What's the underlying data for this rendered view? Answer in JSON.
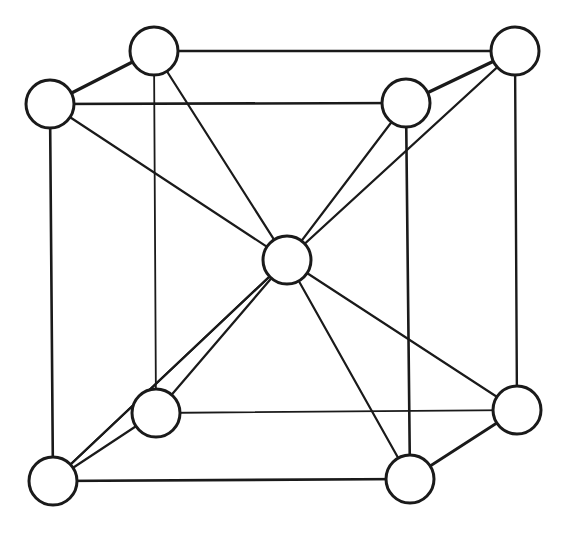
{
  "diagram": {
    "type": "body-centered-cubic-unit-cell",
    "colors": {
      "stroke": "#1a1a1a",
      "fill": "#ffffff",
      "background": "#ffffff"
    },
    "atom_radius": 24,
    "atoms": [
      {
        "id": "back-top-left",
        "x": 154,
        "y": 51
      },
      {
        "id": "back-top-right",
        "x": 515,
        "y": 51
      },
      {
        "id": "back-bottom-left",
        "x": 156,
        "y": 413
      },
      {
        "id": "back-bottom-right",
        "x": 517,
        "y": 410
      },
      {
        "id": "front-top-left",
        "x": 50,
        "y": 104
      },
      {
        "id": "front-top-right",
        "x": 406,
        "y": 103
      },
      {
        "id": "front-bottom-left",
        "x": 53,
        "y": 481
      },
      {
        "id": "front-bottom-right",
        "x": 410,
        "y": 479
      },
      {
        "id": "body-center",
        "x": 287,
        "y": 260
      }
    ],
    "edges": [
      {
        "from": "front-top-left",
        "to": "front-top-right",
        "w": 2.6
      },
      {
        "from": "front-top-right",
        "to": "front-bottom-right",
        "w": 2.6
      },
      {
        "from": "front-bottom-right",
        "to": "front-bottom-left",
        "w": 2.6
      },
      {
        "from": "front-bottom-left",
        "to": "front-top-left",
        "w": 2.6
      },
      {
        "from": "back-top-left",
        "to": "back-top-right",
        "w": 2.4
      },
      {
        "from": "back-top-right",
        "to": "back-bottom-right",
        "w": 2.4
      },
      {
        "from": "back-bottom-right",
        "to": "back-bottom-left",
        "w": 1.8
      },
      {
        "from": "back-bottom-left",
        "to": "back-top-left",
        "w": 1.8
      },
      {
        "from": "front-top-left",
        "to": "back-top-left",
        "w": 3.2
      },
      {
        "from": "front-top-right",
        "to": "back-top-right",
        "w": 3.2
      },
      {
        "from": "front-bottom-left",
        "to": "back-bottom-left",
        "w": 2.2
      },
      {
        "from": "front-bottom-right",
        "to": "back-bottom-right",
        "w": 2.8
      }
    ],
    "diagonals": [
      {
        "from": "front-top-left",
        "to": "body-center"
      },
      {
        "from": "body-center",
        "to": "back-bottom-right"
      },
      {
        "from": "back-top-left",
        "to": "body-center"
      },
      {
        "from": "body-center",
        "to": "front-bottom-right"
      },
      {
        "from": "front-top-right",
        "to": "body-center"
      },
      {
        "from": "body-center",
        "to": "front-bottom-left"
      },
      {
        "from": "back-top-right",
        "to": "body-center"
      },
      {
        "from": "body-center",
        "to": "front-bottom-left"
      },
      {
        "from": "body-center",
        "to": "back-bottom-left"
      }
    ]
  }
}
